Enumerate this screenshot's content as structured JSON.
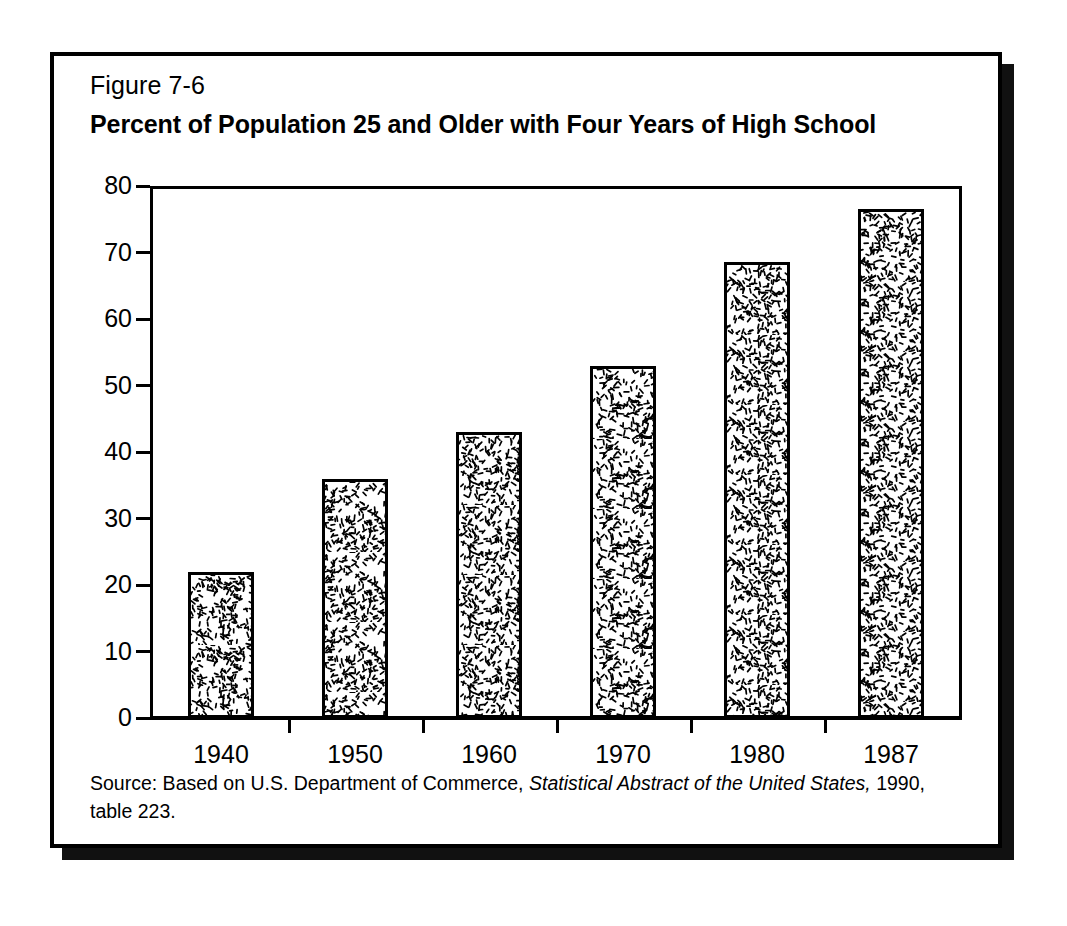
{
  "figure": {
    "number": "Figure 7-6",
    "title": "Percent of Population 25 and Older with Four Years of High School"
  },
  "source": {
    "prefix": "Source:  Based on U.S. Department of Commerce, ",
    "italic_part": "Statistical Abstract of the United States,",
    "suffix": " 1990, table 223."
  },
  "colors": {
    "ink": "#000000",
    "paper": "#ffffff",
    "shadow": "#111111",
    "bar_fill": "#ffffff"
  },
  "chart_data": {
    "type": "bar",
    "title": "Percent of Population 25 and Older with Four Years of High School",
    "xlabel": "",
    "ylabel": "",
    "categories": [
      "1940",
      "1950",
      "1960",
      "1970",
      "1980",
      "1987"
    ],
    "values": [
      22,
      36,
      43,
      53,
      68.5,
      76.5
    ],
    "ylim": [
      0,
      80
    ],
    "yticks": [
      0,
      10,
      20,
      30,
      40,
      50,
      60,
      70,
      80
    ],
    "ytick_labels": [
      "0",
      "10",
      "20",
      "30",
      "40",
      "50",
      "60",
      "70",
      "80"
    ],
    "grid": false,
    "legend": "none",
    "bar_pattern": "random-dash-speckle",
    "series": [
      {
        "name": "Percent with four years of high school",
        "values": [
          22,
          36,
          43,
          53,
          68.5,
          76.5
        ]
      }
    ]
  }
}
